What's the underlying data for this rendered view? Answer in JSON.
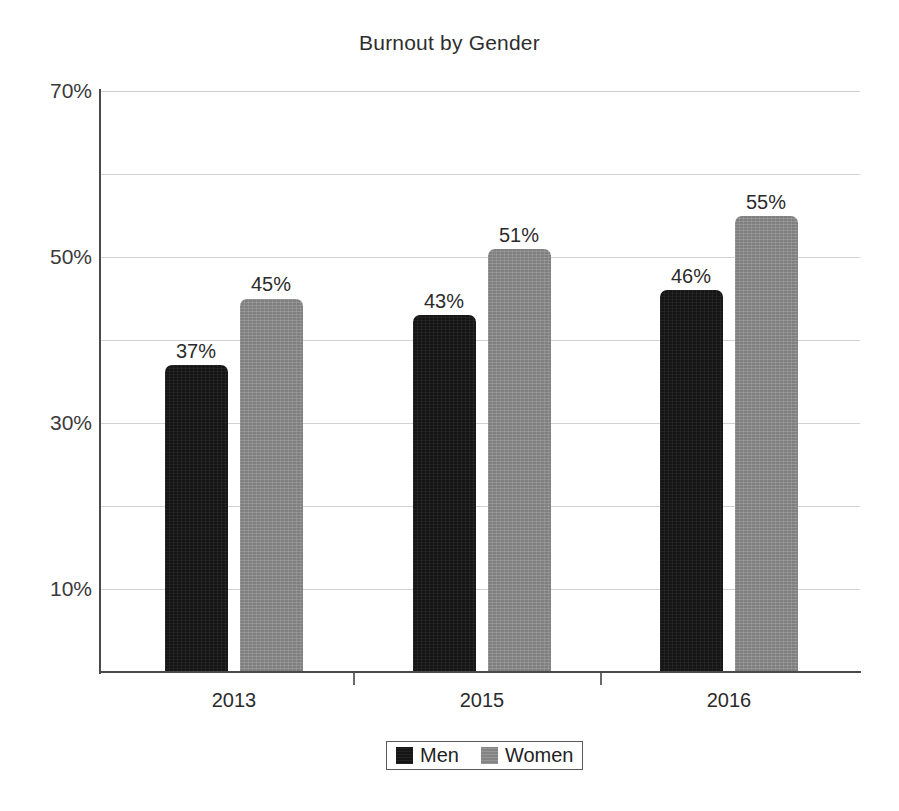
{
  "chart_data": {
    "type": "bar",
    "title": "Burnout by Gender",
    "xlabel": "",
    "ylabel": "",
    "categories": [
      "2013",
      "2015",
      "2016"
    ],
    "series": [
      {
        "name": "Men",
        "values": [
          37,
          43,
          46
        ],
        "color": "#151515",
        "labels": [
          "37%",
          "43%",
          "46%"
        ]
      },
      {
        "name": "Women",
        "values": [
          45,
          51,
          55
        ],
        "color": "#8b8b8b",
        "labels": [
          "45%",
          "51%",
          "55%"
        ]
      }
    ],
    "ylim": [
      0,
      70
    ],
    "y_tick_values": [
      70,
      50,
      30,
      10
    ],
    "y_tick_labels": [
      "70%",
      "50%",
      "30%",
      "10%"
    ],
    "gridline_values": [
      70,
      60,
      50,
      40,
      30,
      20,
      10
    ],
    "grid": true,
    "value_suffix": "%",
    "legend_position": "bottom",
    "legend_entries": [
      "Men",
      "Women"
    ]
  },
  "axis": {
    "y_labels": {
      "t70": "70%",
      "t50": "50%",
      "t30": "30%",
      "t10": "10%"
    },
    "x_labels": {
      "c0": "2013",
      "c1": "2015",
      "c2": "2016"
    }
  },
  "bars": {
    "g0_men": {
      "label": "37%"
    },
    "g0_women": {
      "label": "45%"
    },
    "g1_men": {
      "label": "43%"
    },
    "g1_women": {
      "label": "51%"
    },
    "g2_men": {
      "label": "46%"
    },
    "g2_women": {
      "label": "55%"
    }
  },
  "legend": {
    "men": "Men",
    "women": "Women"
  },
  "colors": {
    "men": "#151515",
    "women": "#8b8b8b",
    "axis": "#4a4a4a",
    "grid": "#d2d2d2",
    "text": "#2b2b2b",
    "background": "#ffffff"
  }
}
